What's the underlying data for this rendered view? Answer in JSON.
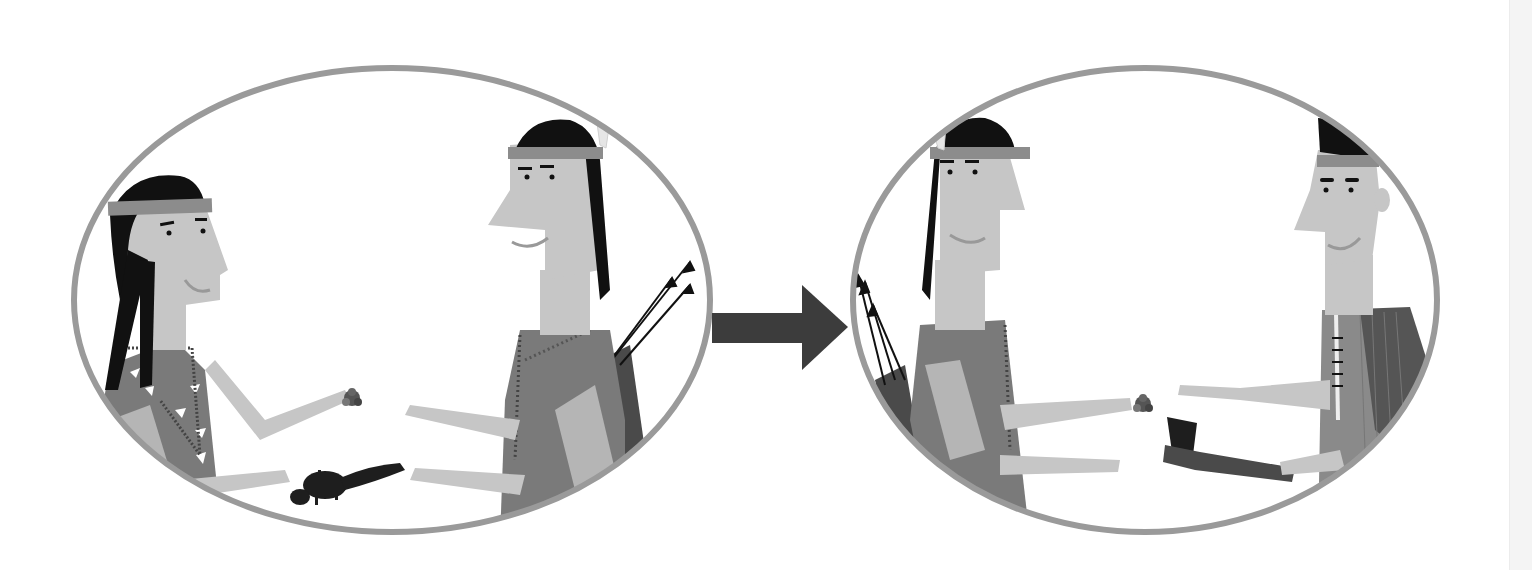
{
  "scene": {
    "description": "Two-panel grayscale illustration of a barter exchange between Native American figures",
    "panels": [
      {
        "id": "left",
        "figures": [
          "woman-with-headband-and-braids",
          "man-with-white-feather-and-quiver"
        ],
        "items_exchanged": [
          "beads",
          "squirrel"
        ]
      },
      {
        "id": "right",
        "figures": [
          "man-with-white-feather-and-quiver",
          "man-with-mohawk-and-feathers"
        ],
        "items_exchanged": [
          "beads",
          "tomahawk"
        ]
      }
    ],
    "connector": "right-arrow"
  },
  "colors": {
    "background": "#ffffff",
    "oval_border": "#9a9a9a",
    "skin": "#c6c6c6",
    "hair": "#111111",
    "headband": "#8c8c8c",
    "clothing_mid": "#7a7a7a",
    "clothing_dark": "#555555",
    "arrow": "#3c3c3c",
    "feather_light": "#e6e6e6",
    "feather_mid": "#8a8a8a",
    "edge_strip": "#f4f4f4"
  }
}
